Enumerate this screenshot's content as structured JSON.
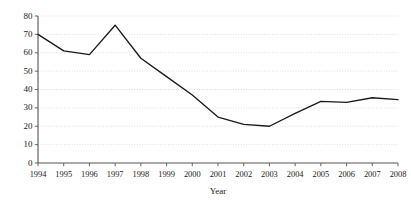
{
  "chart_data": {
    "type": "line",
    "title": "",
    "xlabel": "Year",
    "ylabel": "",
    "categories": [
      "1994",
      "1995",
      "1996",
      "1997",
      "1998",
      "1999",
      "2000",
      "2001",
      "2002",
      "2003",
      "2004",
      "2005",
      "2006",
      "2007",
      "2008"
    ],
    "values": [
      70,
      61,
      59,
      75,
      57,
      47,
      37,
      25,
      21,
      20,
      27,
      33.5,
      33,
      35.5,
      34.5
    ],
    "series": [
      {
        "name": "",
        "values": [
          70,
          61,
          59,
          75,
          57,
          47,
          37,
          25,
          21,
          20,
          27,
          33.5,
          33,
          35.5,
          34.5
        ]
      }
    ],
    "x": [
      "1994",
      "1995",
      "1996",
      "1997",
      "1998",
      "1999",
      "2000",
      "2001",
      "2002",
      "2003",
      "2004",
      "2005",
      "2006",
      "2007",
      "2008"
    ],
    "xlim": [
      "1994",
      "2008"
    ],
    "ylim": [
      0,
      80
    ],
    "yticks": [
      0,
      10,
      20,
      30,
      40,
      50,
      60,
      70,
      80
    ],
    "ytick_labels": [
      "0",
      "10",
      "20",
      "30",
      "40",
      "50",
      "60",
      "70",
      "80"
    ],
    "xtick_labels": [
      "1994",
      "1995",
      "1996",
      "1997",
      "1998",
      "1999",
      "2000",
      "2001",
      "2002",
      "2003",
      "2004",
      "2005",
      "2006",
      "2007",
      "2008"
    ],
    "grid": true,
    "grid_axis": "y",
    "legend": false,
    "legend_position": "none",
    "line_color": "#1a1a1a",
    "grid_color": "#c9c9c9",
    "axis_color": "#555555",
    "background_color": "#ffffff",
    "annotations": []
  }
}
